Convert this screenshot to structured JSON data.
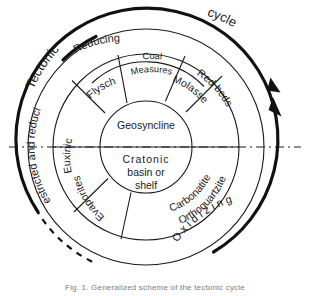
{
  "figure": {
    "center_label_top": "Geosyncline",
    "center_label_bottom_lines": [
      "Cratonic",
      "basin or",
      "shelf"
    ]
  },
  "outer_arc": {
    "label_left": "Tectonic",
    "label_right": "cycle",
    "style": "thick solid arc with double arrowheads at right, dashed at lower left",
    "color": "#111111"
  },
  "rings": {
    "outer": {
      "name": "redox-conditions-ring",
      "segments": [
        {
          "id": "reducing",
          "label": "Reducing"
        },
        {
          "id": "oxidizing",
          "label": "O x i d i z i n g"
        },
        {
          "id": "restricted-and-reducing",
          "label": "Restricted and reducing"
        }
      ]
    },
    "middle": {
      "name": "lithofacies-ring",
      "segments": [
        {
          "id": "flysch",
          "label": "Flysch"
        },
        {
          "id": "coal-measures",
          "label_lines": [
            "Coal",
            "Measures"
          ]
        },
        {
          "id": "molasse",
          "label": "Molasse"
        },
        {
          "id": "red-beds",
          "label": "Red beds"
        },
        {
          "id": "orthoquartzite-carbonatite",
          "label_lines": [
            "Orthoquartzite",
            "Carbonatite"
          ]
        },
        {
          "id": "evaporites",
          "label": "Evaporites"
        },
        {
          "id": "euxinic",
          "label": "Euxinic"
        }
      ]
    },
    "core": {
      "name": "tectonic-setting-core",
      "segments": [
        {
          "id": "geosyncline",
          "label": "Geosyncline"
        },
        {
          "id": "cratonic-basin-or-shelf",
          "label": "Cratonic basin or shelf"
        }
      ]
    }
  },
  "caption": {
    "text": "Fig. 1.  Generalized scheme of the tectonic cycle"
  },
  "colors": {
    "ink": "#1a1a1a",
    "arc": "#111111",
    "background": "#ffffff",
    "caption": "#7c7c7c"
  }
}
